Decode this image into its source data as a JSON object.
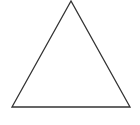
{
  "diagram": {
    "shape": "triangle",
    "kind": "isosceles",
    "stroke_color": "#333333",
    "fill_color": "#ffffff",
    "labels": []
  }
}
